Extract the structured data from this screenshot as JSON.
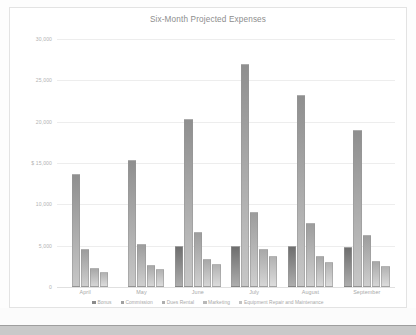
{
  "chart_data": {
    "type": "bar",
    "title": "Six-Month Projected Expenses",
    "xlabel": "",
    "ylabel": "",
    "categories": [
      "April",
      "May",
      "June",
      "July",
      "August",
      "September"
    ],
    "series": [
      {
        "name": "Bonus",
        "color": "#8a8a8a",
        "values": [
          0,
          0,
          4980,
          4950,
          4960,
          4900
        ]
      },
      {
        "name": "Commission",
        "color": "#a0a0a0",
        "values": [
          13700,
          15400,
          20300,
          27000,
          23200,
          19000
        ]
      },
      {
        "name": "Dues Rental",
        "color": "#aeaeae",
        "values": [
          4600,
          5200,
          6700,
          9100,
          7700,
          6300
        ]
      },
      {
        "name": "Marketing",
        "color": "#b8b8b8",
        "values": [
          2300,
          2700,
          3400,
          4600,
          3800,
          3200
        ]
      },
      {
        "name": "Equipment Repair and Maintenance",
        "color": "#c2c2c2",
        "values": [
          1800,
          2200,
          2800,
          3700,
          3000,
          2500
        ]
      }
    ],
    "ylim": [
      0,
      30000
    ],
    "yticks": [
      {
        "value": 0,
        "label": "0"
      },
      {
        "value": 5000,
        "label": "5,000"
      },
      {
        "value": 10000,
        "label": "10,000"
      },
      {
        "value": 15000,
        "label": "$ 15,000"
      },
      {
        "value": 20000,
        "label": "20,000"
      },
      {
        "value": 25000,
        "label": "25,000"
      },
      {
        "value": 30000,
        "label": "30,000"
      }
    ],
    "grid": true,
    "legend_position": "bottom"
  }
}
